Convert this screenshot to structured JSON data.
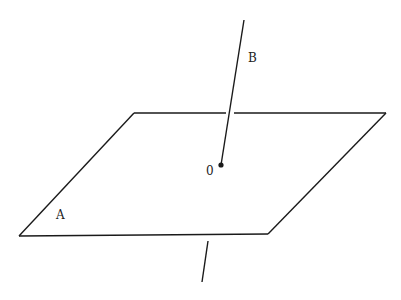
{
  "diagram": {
    "labels": {
      "plane": "A",
      "line": "B",
      "intersection": "0"
    },
    "colors": {
      "stroke": "#1a1a1a",
      "background": "#ffffff"
    }
  }
}
